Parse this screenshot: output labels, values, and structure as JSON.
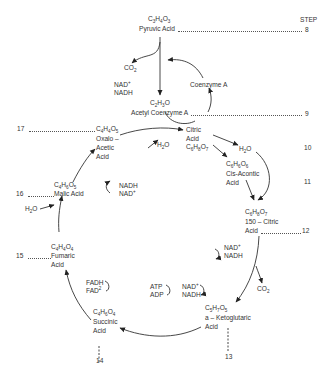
{
  "header": {
    "step_label": "STEP"
  },
  "compounds": {
    "pyruvic": {
      "formula": [
        "C",
        "3",
        "H",
        "4",
        "O",
        "3"
      ],
      "name": "Pyruvic Acid",
      "step": "8"
    },
    "acetyl_coa": {
      "formula": [
        "C",
        "2",
        "H",
        "3",
        "O",
        ""
      ],
      "name": "Acetyl Coenzyme A",
      "step": "9"
    },
    "citric": {
      "line1": "Citric",
      "line2": "Acid",
      "formula": [
        "C",
        "6",
        "H",
        "8",
        "O",
        "7"
      ],
      "step": "10"
    },
    "cis_aconitic": {
      "formula": [
        "C",
        "6",
        "H",
        "6",
        "O",
        "6"
      ],
      "line1": "Cis-Acontic",
      "line2": "Acid",
      "step": "11"
    },
    "iso_citric": {
      "formula": [
        "C",
        "6",
        "H",
        "8",
        "O",
        "7"
      ],
      "line1": "150 – Citric",
      "line2": "Acid",
      "step": "12"
    },
    "ketoglutaric": {
      "formula": [
        "C",
        "5",
        "H",
        "7",
        "O",
        "5"
      ],
      "line1": "a – Ketoglutaric",
      "line2": "Acid",
      "step": "13"
    },
    "succinic": {
      "formula": [
        "C",
        "4",
        "H",
        "6",
        "O",
        "4"
      ],
      "line1": "Succinic",
      "line2": "Acid",
      "step": "14"
    },
    "fumaric": {
      "formula": [
        "C",
        "4",
        "H",
        "4",
        "O",
        "4"
      ],
      "line1": "Fumaric",
      "line2": "Acid",
      "step": "15"
    },
    "malic": {
      "formula": [
        "C",
        "4",
        "H",
        "6",
        "O",
        "5"
      ],
      "name": "Malic Acid",
      "step": "16"
    },
    "oxaloacetic": {
      "formula": [
        "C",
        "4",
        "H",
        "4",
        "O",
        "5"
      ],
      "line1": "Oxalo –",
      "line2": "Acetic",
      "line3": "Acid",
      "step": "17"
    }
  },
  "cofactors": {
    "co2_top": {
      "base": "CO",
      "sub": "2"
    },
    "nad_top": {
      "line1_base": "NAD",
      "line1_sup": "+",
      "line2": "NADH"
    },
    "coenzyme_a": "Coenzyme A",
    "h2o_citric": {
      "base": "H",
      "sub": "2",
      "rest": "O"
    },
    "h2o_aconitic": {
      "base": "H",
      "sub": "2",
      "rest": "O"
    },
    "nad_iso": {
      "line1_base": "NAD",
      "line1_sup": "+",
      "line2": "NADH"
    },
    "co2_iso": {
      "base": "CO",
      "sub": "2"
    },
    "nad_keto": {
      "line1_base": "NAD",
      "line1_sup": "+",
      "line2": "NADH"
    },
    "atp_adp": {
      "line1": "ATP",
      "line2": "ADP"
    },
    "fad": {
      "line1": "FADH",
      "line2_base": "FAD",
      "line2_sup": "2"
    },
    "h2o_fumaric": {
      "base": "H",
      "sub": "2",
      "rest": "O"
    },
    "nadh_malic": {
      "line1": "NADH",
      "line2_base": "NAD",
      "line2_sup": "+"
    }
  }
}
